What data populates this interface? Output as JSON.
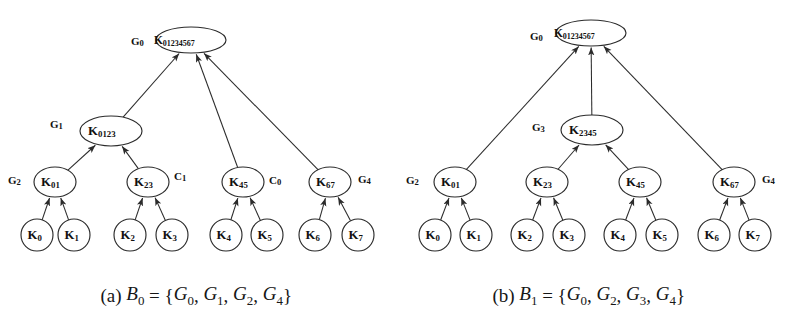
{
  "figure": {
    "background_color": "#ffffff",
    "line_color": "#2b2b2b",
    "text_color": "#111111",
    "panels": [
      {
        "id": "panel-a",
        "caption_prefix": "(a)",
        "caption_set_name": "B",
        "caption_set_index": "0",
        "caption_equals": "=",
        "caption_members": [
          "G0",
          "G1",
          "G2",
          "G4"
        ],
        "caption_text": "(a)  B0 = {G0, G1, G2, G4}",
        "nodes": [
          {
            "id": "a-root",
            "base": "K",
            "sub": "01234567",
            "shape": "ellipse",
            "cx": 191,
            "cy": 40,
            "rx": 35,
            "ry": 13
          },
          {
            "id": "a-k0123",
            "base": "K",
            "sub": "0123",
            "shape": "ellipse",
            "cx": 111,
            "cy": 131,
            "rx": 31,
            "ry": 15
          },
          {
            "id": "a-k01",
            "base": "K",
            "sub": "01",
            "shape": "ellipse",
            "cx": 55,
            "cy": 182,
            "rx": 21,
            "ry": 15
          },
          {
            "id": "a-k23",
            "base": "K",
            "sub": "23",
            "shape": "ellipse",
            "cx": 148,
            "cy": 182,
            "rx": 21,
            "ry": 15
          },
          {
            "id": "a-k45",
            "base": "K",
            "sub": "45",
            "shape": "ellipse",
            "cx": 243,
            "cy": 182,
            "rx": 21,
            "ry": 15
          },
          {
            "id": "a-k67",
            "base": "K",
            "sub": "67",
            "shape": "ellipse",
            "cx": 330,
            "cy": 182,
            "rx": 21,
            "ry": 15
          },
          {
            "id": "a-k0",
            "base": "K",
            "sub": "0",
            "shape": "circle",
            "cx": 37,
            "cy": 235,
            "rx": 16,
            "ry": 16
          },
          {
            "id": "a-k1",
            "base": "K",
            "sub": "1",
            "shape": "circle",
            "cx": 74,
            "cy": 235,
            "rx": 16,
            "ry": 16
          },
          {
            "id": "a-k2",
            "base": "K",
            "sub": "2",
            "shape": "circle",
            "cx": 130,
            "cy": 235,
            "rx": 16,
            "ry": 16
          },
          {
            "id": "a-k3",
            "base": "K",
            "sub": "3",
            "shape": "circle",
            "cx": 172,
            "cy": 235,
            "rx": 16,
            "ry": 16
          },
          {
            "id": "a-k4",
            "base": "K",
            "sub": "4",
            "shape": "circle",
            "cx": 226,
            "cy": 235,
            "rx": 16,
            "ry": 16
          },
          {
            "id": "a-k5",
            "base": "K",
            "sub": "5",
            "shape": "circle",
            "cx": 267,
            "cy": 235,
            "rx": 16,
            "ry": 16
          },
          {
            "id": "a-k6",
            "base": "K",
            "sub": "6",
            "shape": "circle",
            "cx": 315,
            "cy": 235,
            "rx": 16,
            "ry": 16
          },
          {
            "id": "a-k7",
            "base": "K",
            "sub": "7",
            "shape": "circle",
            "cx": 358,
            "cy": 235,
            "rx": 16,
            "ry": 16
          }
        ],
        "group_labels": [
          {
            "id": "a-g0",
            "base": "G",
            "sub": "0",
            "x": 131,
            "y": 41,
            "anchor": "start"
          },
          {
            "id": "a-g1",
            "base": "G",
            "sub": "1",
            "x": 50,
            "y": 124,
            "anchor": "start"
          },
          {
            "id": "a-g2",
            "base": "G",
            "sub": "2",
            "x": 8,
            "y": 180,
            "anchor": "start"
          },
          {
            "id": "a-c1",
            "base": "C",
            "sub": "1",
            "x": 174,
            "y": 176,
            "anchor": "start"
          },
          {
            "id": "a-c0",
            "base": "C",
            "sub": "0",
            "x": 269,
            "y": 180,
            "anchor": "start"
          },
          {
            "id": "a-g4",
            "base": "G",
            "sub": "4",
            "x": 358,
            "y": 179,
            "anchor": "start"
          }
        ],
        "edges": [
          {
            "from": "a-k0",
            "to": "a-k01"
          },
          {
            "from": "a-k1",
            "to": "a-k01"
          },
          {
            "from": "a-k2",
            "to": "a-k23"
          },
          {
            "from": "a-k3",
            "to": "a-k23"
          },
          {
            "from": "a-k4",
            "to": "a-k45"
          },
          {
            "from": "a-k5",
            "to": "a-k45"
          },
          {
            "from": "a-k6",
            "to": "a-k67"
          },
          {
            "from": "a-k7",
            "to": "a-k67"
          },
          {
            "from": "a-k01",
            "to": "a-k0123"
          },
          {
            "from": "a-k23",
            "to": "a-k0123"
          },
          {
            "from": "a-k0123",
            "to": "a-root"
          },
          {
            "from": "a-k45",
            "to": "a-root"
          },
          {
            "from": "a-k67",
            "to": "a-root"
          }
        ]
      },
      {
        "id": "panel-b",
        "caption_prefix": "(b)",
        "caption_set_name": "B",
        "caption_set_index": "1",
        "caption_equals": "=",
        "caption_members": [
          "G0",
          "G2",
          "G3",
          "G4"
        ],
        "caption_text": "(b)  B1 = {G0, G2, G3, G4}",
        "nodes": [
          {
            "id": "b-root",
            "base": "K",
            "sub": "01234567",
            "shape": "ellipse",
            "cx": 199,
            "cy": 33,
            "rx": 35,
            "ry": 13
          },
          {
            "id": "b-k2345",
            "base": "K",
            "sub": "2345",
            "shape": "ellipse",
            "cx": 200,
            "cy": 130,
            "rx": 31,
            "ry": 15
          },
          {
            "id": "b-k01",
            "base": "K",
            "sub": "01",
            "shape": "ellipse",
            "cx": 63,
            "cy": 182,
            "rx": 21,
            "ry": 15
          },
          {
            "id": "b-k23",
            "base": "K",
            "sub": "23",
            "shape": "ellipse",
            "cx": 155,
            "cy": 182,
            "rx": 21,
            "ry": 15
          },
          {
            "id": "b-k45",
            "base": "K",
            "sub": "45",
            "shape": "ellipse",
            "cx": 248,
            "cy": 182,
            "rx": 21,
            "ry": 15
          },
          {
            "id": "b-k67",
            "base": "K",
            "sub": "67",
            "shape": "ellipse",
            "cx": 342,
            "cy": 182,
            "rx": 21,
            "ry": 15
          },
          {
            "id": "b-k0",
            "base": "K",
            "sub": "0",
            "shape": "circle",
            "cx": 43,
            "cy": 235,
            "rx": 16,
            "ry": 16
          },
          {
            "id": "b-k1",
            "base": "K",
            "sub": "1",
            "shape": "circle",
            "cx": 84,
            "cy": 235,
            "rx": 16,
            "ry": 16
          },
          {
            "id": "b-k2",
            "base": "K",
            "sub": "2",
            "shape": "circle",
            "cx": 135,
            "cy": 235,
            "rx": 16,
            "ry": 16
          },
          {
            "id": "b-k3",
            "base": "K",
            "sub": "3",
            "shape": "circle",
            "cx": 177,
            "cy": 235,
            "rx": 16,
            "ry": 16
          },
          {
            "id": "b-k4",
            "base": "K",
            "sub": "4",
            "shape": "circle",
            "cx": 228,
            "cy": 235,
            "rx": 16,
            "ry": 16
          },
          {
            "id": "b-k5",
            "base": "K",
            "sub": "5",
            "shape": "circle",
            "cx": 270,
            "cy": 235,
            "rx": 16,
            "ry": 16
          },
          {
            "id": "b-k6",
            "base": "K",
            "sub": "6",
            "shape": "circle",
            "cx": 322,
            "cy": 235,
            "rx": 16,
            "ry": 16
          },
          {
            "id": "b-k7",
            "base": "K",
            "sub": "7",
            "shape": "circle",
            "cx": 363,
            "cy": 235,
            "rx": 16,
            "ry": 16
          }
        ],
        "group_labels": [
          {
            "id": "b-g0",
            "base": "G",
            "sub": "0",
            "x": 138,
            "y": 36,
            "anchor": "start"
          },
          {
            "id": "b-g3",
            "base": "G",
            "sub": "3",
            "x": 140,
            "y": 127,
            "anchor": "start"
          },
          {
            "id": "b-g2",
            "base": "G",
            "sub": "2",
            "x": 14,
            "y": 180,
            "anchor": "start"
          },
          {
            "id": "b-g4",
            "base": "G",
            "sub": "4",
            "x": 370,
            "y": 179,
            "anchor": "start"
          }
        ],
        "edges": [
          {
            "from": "b-k0",
            "to": "b-k01"
          },
          {
            "from": "b-k1",
            "to": "b-k01"
          },
          {
            "from": "b-k2",
            "to": "b-k23"
          },
          {
            "from": "b-k3",
            "to": "b-k23"
          },
          {
            "from": "b-k4",
            "to": "b-k45"
          },
          {
            "from": "b-k5",
            "to": "b-k45"
          },
          {
            "from": "b-k6",
            "to": "b-k67"
          },
          {
            "from": "b-k7",
            "to": "b-k67"
          },
          {
            "from": "b-k23",
            "to": "b-k2345"
          },
          {
            "from": "b-k45",
            "to": "b-k2345"
          },
          {
            "from": "b-k01",
            "to": "b-root"
          },
          {
            "from": "b-k2345",
            "to": "b-root"
          },
          {
            "from": "b-k67",
            "to": "b-root"
          }
        ]
      }
    ]
  }
}
